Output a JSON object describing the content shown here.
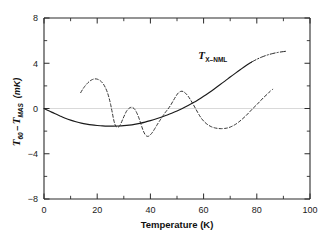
{
  "chart_data": {
    "type": "line",
    "title": "",
    "xlabel": "Temperature  (K)",
    "ylabel": "T_60 - T_MAS  (mK)",
    "ylabel_parts": {
      "t1_main": "T",
      "t1_sub": "60",
      "minus": "–",
      "t2_main": "T",
      "t2_sub": "MAS",
      "unit": "(mK)"
    },
    "xlim": [
      0,
      100
    ],
    "ylim": [
      -8,
      8
    ],
    "xticks": [
      0,
      20,
      40,
      60,
      80,
      100
    ],
    "xtick_labels": [
      "0",
      "20",
      "40",
      "60",
      "80",
      "100"
    ],
    "xminor_ticks": [
      10,
      30,
      50,
      70,
      90
    ],
    "yticks": [
      8,
      4,
      0,
      -4,
      -8
    ],
    "ytick_labels": [
      "8",
      "4",
      "0",
      "−4",
      "−8"
    ],
    "yminor_ticks": [
      6,
      2,
      -2,
      -6
    ],
    "grid": false,
    "legend": "none",
    "zero_line": 0,
    "annotations": [
      {
        "name": "tx-nml-label",
        "text": "T_X-NML",
        "main": "T",
        "sub": "X–NML",
        "x": 58,
        "y": 4.4
      }
    ],
    "series": [
      {
        "name": "T_X-NML",
        "style": "solid",
        "color": "#1a1a1a",
        "label": "T X-NML",
        "points": [
          [
            0.0,
            0.0
          ],
          [
            2.0,
            -0.22
          ],
          [
            4.0,
            -0.45
          ],
          [
            6.0,
            -0.66
          ],
          [
            8.0,
            -0.86
          ],
          [
            10.0,
            -1.03
          ],
          [
            12.0,
            -1.17
          ],
          [
            14.0,
            -1.29
          ],
          [
            16.0,
            -1.38
          ],
          [
            18.0,
            -1.45
          ],
          [
            20.0,
            -1.5
          ],
          [
            22.0,
            -1.54
          ],
          [
            24.0,
            -1.56
          ],
          [
            26.0,
            -1.56
          ],
          [
            28.0,
            -1.55
          ],
          [
            30.0,
            -1.52
          ],
          [
            32.0,
            -1.47
          ],
          [
            34.0,
            -1.4
          ],
          [
            36.0,
            -1.31
          ],
          [
            38.0,
            -1.2
          ],
          [
            40.0,
            -1.07
          ],
          [
            42.0,
            -0.93
          ],
          [
            44.0,
            -0.77
          ],
          [
            46.0,
            -0.6
          ],
          [
            48.0,
            -0.42
          ],
          [
            50.0,
            -0.22
          ],
          [
            52.0,
            0.0
          ],
          [
            54.0,
            0.24
          ],
          [
            56.0,
            0.5
          ],
          [
            58.0,
            0.78
          ],
          [
            60.0,
            1.08
          ],
          [
            62.0,
            1.4
          ],
          [
            64.0,
            1.73
          ],
          [
            66.0,
            2.07
          ],
          [
            68.0,
            2.42
          ],
          [
            70.0,
            2.78
          ],
          [
            72.0,
            3.13
          ],
          [
            74.0,
            3.47
          ],
          [
            76.0,
            3.8
          ],
          [
            78.0,
            4.1
          ],
          [
            80.0,
            4.35
          ],
          [
            82.0,
            4.56
          ],
          [
            84.0,
            4.73
          ],
          [
            86.0,
            4.86
          ],
          [
            88.0,
            4.96
          ],
          [
            90.0,
            5.03
          ],
          [
            91.0,
            5.06
          ]
        ],
        "dash_tail_from_x": 78
      },
      {
        "name": "measured-oscillation",
        "style": "dashed",
        "color": "#2a2a2a",
        "label": "",
        "points": [
          [
            13.8,
            1.4
          ],
          [
            14.5,
            1.68
          ],
          [
            15.3,
            1.95
          ],
          [
            16.2,
            2.2
          ],
          [
            17.2,
            2.42
          ],
          [
            18.2,
            2.56
          ],
          [
            19.2,
            2.62
          ],
          [
            20.2,
            2.58
          ],
          [
            21.2,
            2.45
          ],
          [
            22.2,
            2.2
          ],
          [
            23.0,
            1.88
          ],
          [
            23.8,
            1.44
          ],
          [
            24.5,
            0.9
          ],
          [
            25.1,
            0.3
          ],
          [
            25.7,
            -0.4
          ],
          [
            26.2,
            -1.0
          ],
          [
            26.7,
            -1.42
          ],
          [
            27.2,
            -1.62
          ],
          [
            27.8,
            -1.66
          ],
          [
            28.4,
            -1.55
          ],
          [
            29.0,
            -1.28
          ],
          [
            29.6,
            -0.95
          ],
          [
            30.3,
            -0.58
          ],
          [
            31.0,
            -0.25
          ],
          [
            31.8,
            -0.02
          ],
          [
            32.6,
            0.1
          ],
          [
            33.4,
            0.08
          ],
          [
            34.2,
            -0.1
          ],
          [
            35.0,
            -0.45
          ],
          [
            35.8,
            -0.92
          ],
          [
            36.5,
            -1.42
          ],
          [
            37.2,
            -1.9
          ],
          [
            37.9,
            -2.26
          ],
          [
            38.6,
            -2.44
          ],
          [
            39.3,
            -2.45
          ],
          [
            40.0,
            -2.32
          ],
          [
            40.8,
            -2.1
          ],
          [
            41.6,
            -1.8
          ],
          [
            42.5,
            -1.45
          ],
          [
            43.5,
            -1.08
          ],
          [
            44.5,
            -0.72
          ],
          [
            45.5,
            -0.38
          ],
          [
            46.5,
            -0.08
          ],
          [
            47.5,
            0.25
          ],
          [
            48.5,
            0.65
          ],
          [
            49.5,
            1.05
          ],
          [
            50.5,
            1.38
          ],
          [
            51.5,
            1.52
          ],
          [
            52.3,
            1.5
          ],
          [
            53.2,
            1.35
          ],
          [
            54.2,
            1.08
          ],
          [
            55.2,
            0.72
          ],
          [
            56.2,
            0.32
          ],
          [
            57.2,
            -0.1
          ],
          [
            58.2,
            -0.52
          ],
          [
            59.2,
            -0.88
          ],
          [
            60.3,
            -1.18
          ],
          [
            61.5,
            -1.42
          ],
          [
            62.8,
            -1.6
          ],
          [
            64.0,
            -1.7
          ],
          [
            65.3,
            -1.76
          ],
          [
            66.6,
            -1.78
          ],
          [
            68.0,
            -1.76
          ],
          [
            69.3,
            -1.7
          ],
          [
            70.6,
            -1.58
          ],
          [
            72.0,
            -1.4
          ],
          [
            73.3,
            -1.18
          ],
          [
            74.6,
            -0.92
          ],
          [
            76.0,
            -0.62
          ],
          [
            77.3,
            -0.3
          ],
          [
            78.6,
            0.02
          ],
          [
            80.0,
            0.34
          ],
          [
            81.3,
            0.66
          ],
          [
            82.6,
            0.98
          ],
          [
            84.0,
            1.28
          ],
          [
            85.0,
            1.52
          ],
          [
            86.0,
            1.7
          ]
        ]
      }
    ]
  },
  "axes": {
    "frame_color": "#2b2b2b",
    "zero_line_color": "#bdbdbd"
  }
}
